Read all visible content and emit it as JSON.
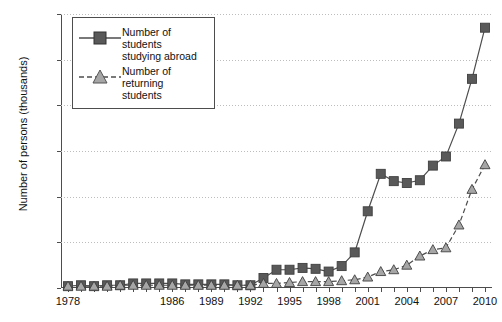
{
  "chart_data": {
    "type": "line",
    "title": "",
    "xlabel": "",
    "ylabel": "Number of persons (thousands)",
    "ylim": [
      0,
      300
    ],
    "yticks": [
      0,
      50,
      100,
      150,
      200,
      250,
      300
    ],
    "xlim": [
      1978,
      2010
    ],
    "x": [
      1978,
      1979,
      1980,
      1981,
      1982,
      1983,
      1984,
      1985,
      1986,
      1987,
      1988,
      1989,
      1990,
      1991,
      1992,
      1993,
      1994,
      1995,
      1996,
      1997,
      1998,
      1999,
      2000,
      2001,
      2002,
      2003,
      2004,
      2005,
      2006,
      2007,
      2008,
      2009,
      2010
    ],
    "xtick_labels": [
      "1978",
      "1986",
      "1989",
      "1992",
      "1995",
      "1998",
      "2001",
      "2004",
      "2007",
      "2010"
    ],
    "xtick_values": [
      1978,
      1986,
      1989,
      1992,
      1995,
      1998,
      2001,
      2004,
      2007,
      2010
    ],
    "grid": true,
    "legend_position": "top-left",
    "series": [
      {
        "name": "Number of students studying abroad",
        "marker": "square",
        "linestyle": "solid",
        "color": "#595959",
        "values": [
          2,
          3,
          2,
          3,
          3,
          5,
          5,
          5,
          5,
          4,
          4,
          4,
          4,
          3,
          3,
          11,
          20,
          20,
          22,
          21,
          18,
          24,
          39,
          84,
          125,
          117,
          115,
          118,
          134,
          144,
          180,
          229,
          285
        ]
      },
      {
        "name": "Number of returning students",
        "marker": "triangle",
        "linestyle": "dashed",
        "color": "#a6a6a6",
        "values": [
          2,
          2,
          2,
          2,
          3,
          3,
          3,
          3,
          3,
          3,
          3,
          3,
          3,
          3,
          3,
          5,
          5,
          6,
          7,
          7,
          7,
          8,
          9,
          12,
          18,
          20,
          25,
          35,
          42,
          44,
          69,
          108,
          135
        ]
      }
    ]
  },
  "legend": {
    "items": [
      {
        "label_line1": "Number of students",
        "label_line2": "studying abroad"
      },
      {
        "label_line1": "Number of returning",
        "label_line2": "students"
      }
    ]
  }
}
